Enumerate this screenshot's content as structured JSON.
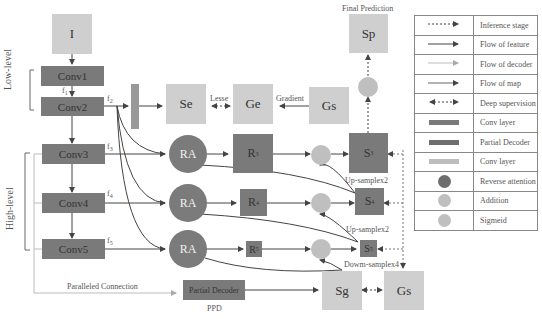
{
  "title": "Final Prediction",
  "input": {
    "label": "I"
  },
  "groups": {
    "low": "Low-level",
    "high": "High-level"
  },
  "conv_layers": [
    {
      "label": "Conv1",
      "feature": "f",
      "feature_sub": "1"
    },
    {
      "label": "Conv2",
      "feature": "f",
      "feature_sub": "2"
    },
    {
      "label": "Conv3",
      "feature": "f",
      "feature_sub": "3"
    },
    {
      "label": "Conv4",
      "feature": "f",
      "feature_sub": "4"
    },
    {
      "label": "Conv5",
      "feature": "f",
      "feature_sub": "5"
    }
  ],
  "edge_branch": {
    "se": "Se",
    "ge": "Ge",
    "gs": "Gs",
    "lesse": "Lesse",
    "gradient": "Gradient"
  },
  "ra_blocks": [
    {
      "label": "RA",
      "r": "R",
      "r_sub": "3",
      "s": "S",
      "s_sub": "3"
    },
    {
      "label": "RA",
      "r": "R",
      "r_sub": "4",
      "s": "S",
      "s_sub": "4"
    },
    {
      "label": "RA",
      "r": "R",
      "r_sub": "5",
      "s": "S",
      "s_sub": "5"
    }
  ],
  "sp": "Sp",
  "annotations": {
    "up1": "Up-samplex2",
    "up2": "Up-samplex2",
    "down": "Dowm-samplex4",
    "paralleled": "Paralleled  Connection",
    "partial_decoder": "Partial Decoder",
    "ppd": "PPD",
    "sg": "Sg",
    "gs2": "Gs"
  },
  "legend": [
    {
      "symbol": "dashed-arrow",
      "label": "Inference stage"
    },
    {
      "symbol": "solid-arrow",
      "label": "Flow of feature"
    },
    {
      "symbol": "light-arrow",
      "label": "Flow of decoder"
    },
    {
      "symbol": "gray-arrow",
      "label": "Flow of map"
    },
    {
      "symbol": "double-dashed-arrow",
      "label": "Deep supervision"
    },
    {
      "symbol": "dark-bar",
      "label": "Conv layer"
    },
    {
      "symbol": "dark-bar",
      "label": "Partial Decoder"
    },
    {
      "symbol": "light-bar",
      "label": "Conv layer"
    },
    {
      "symbol": "dark-circle",
      "label": "Reverse attention"
    },
    {
      "symbol": "light-circle",
      "label": "Addition"
    },
    {
      "symbol": "light-circle",
      "label": "Sigmeid"
    }
  ],
  "colors": {
    "dark": "#7a7a7a",
    "light": "#cfcfcf",
    "circle_light": "#bfbfbf",
    "line": "#444444"
  }
}
